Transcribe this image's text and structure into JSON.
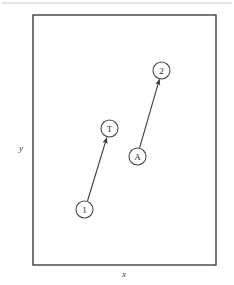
{
  "figure": {
    "background_color": "#ffffff",
    "ink_color": "#3a3a3a",
    "node_stroke_color": "#4a4a4a",
    "frame": {
      "name": "plot-frame",
      "x": 33,
      "y": 15,
      "width": 183,
      "height": 250,
      "stroke_width": 1.4,
      "color": "#3f3f3f"
    },
    "top_rule": {
      "name": "page-top-rule",
      "x1": 2,
      "y1": 3,
      "x2": 232,
      "y2": 3,
      "color": "#c9c9c9"
    },
    "axes": {
      "x_label": "x",
      "y_label": "y",
      "x_label_pos": {
        "x": 124,
        "y": 274
      },
      "y_label_pos": {
        "x": 21,
        "y": 148
      }
    },
    "nodes": [
      {
        "id": "node-1",
        "label": "1",
        "cx": 84.5,
        "cy": 209.5,
        "r": 8.5
      },
      {
        "id": "node-t",
        "label": "T",
        "cx": 109.5,
        "cy": 128.5,
        "r": 8.5
      },
      {
        "id": "node-a",
        "label": "A",
        "cx": 137.5,
        "cy": 156.5,
        "r": 8.5
      },
      {
        "id": "node-2",
        "label": "2",
        "cx": 161.5,
        "cy": 70.5,
        "r": 8.5
      }
    ],
    "arrows": [
      {
        "id": "arrow-1-to-t",
        "from": "1",
        "to": "T",
        "x1": 87.5,
        "y1": 201.0,
        "x2": 106.8,
        "y2": 137.6
      },
      {
        "id": "arrow-a-to-2",
        "from": "A",
        "to": "2",
        "x1": 139.6,
        "y1": 147.9,
        "x2": 159.4,
        "y2": 79.3
      }
    ]
  }
}
